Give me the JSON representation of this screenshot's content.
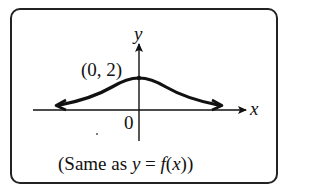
{
  "diagram": {
    "axes": {
      "x_label": "x",
      "y_label": "y",
      "origin_label": "0"
    },
    "point": {
      "label": "(0, 2)",
      "x": 0,
      "y": 2
    },
    "caption": {
      "prefix": "(Same as ",
      "y": "y",
      "eq": " = ",
      "f": "f",
      "open": "(",
      "x": "x",
      "close": "))"
    },
    "curve": "bell-shaped curve symmetric about the y-axis, maximum at (0, 2), approaching the x-axis as asymptote in both directions"
  }
}
